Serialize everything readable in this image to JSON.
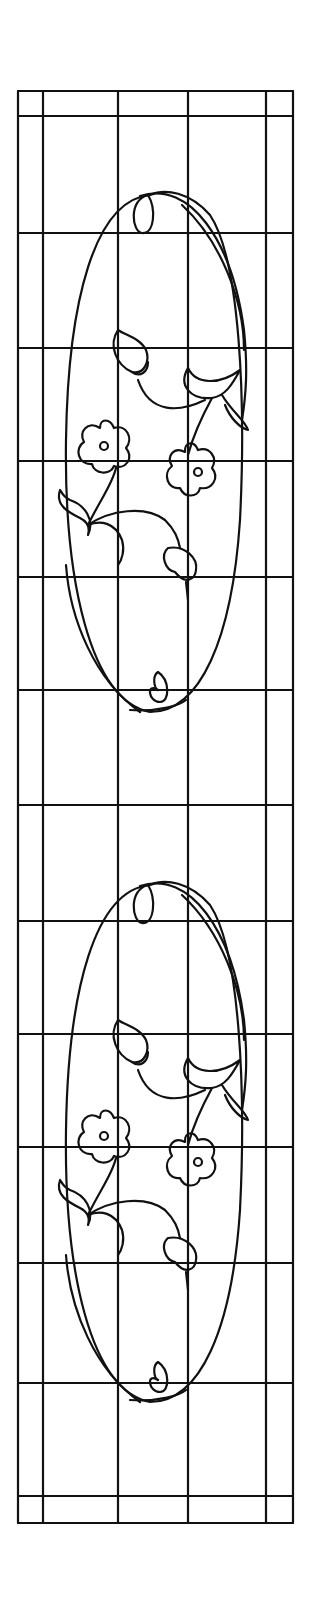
{
  "diagram": {
    "caption": "",
    "colors": {
      "line": "#111111",
      "background": "#ffffff"
    },
    "frame": {
      "outer": {
        "left": 18,
        "top": 91,
        "right": 293,
        "bottom": 1523
      },
      "vertical_lines_x": [
        18,
        43,
        118,
        188,
        266,
        293
      ],
      "horizontal_lines_y": [
        91,
        116,
        233,
        348,
        461,
        577,
        690,
        805,
        921,
        1034,
        1147,
        1263,
        1383,
        1496,
        1523
      ]
    },
    "medallions": [
      {
        "name": "upper-medallion",
        "offset_y": 0
      },
      {
        "name": "lower-medallion",
        "offset_y": 690
      }
    ]
  }
}
